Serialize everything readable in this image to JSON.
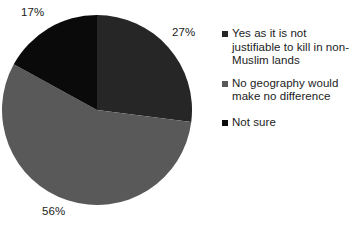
{
  "title": "",
  "chart_data": {
    "type": "pie",
    "title": "",
    "xlabel": "",
    "ylabel": "",
    "legend_position": "right",
    "grid": false,
    "start_angle_deg": 0,
    "direction": "clockwise",
    "categories": [
      "Yes as it is not justifiable to kill in non-Muslim lands",
      "No geography would make no difference",
      "Not sure"
    ],
    "values": [
      27,
      56,
      17
    ],
    "value_unit": "%",
    "data_labels": [
      "27%",
      "56%",
      "17%"
    ],
    "colors": [
      "#262626",
      "#595959",
      "#0a0a0a"
    ],
    "slices": [
      {
        "label": "Yes as it is not justifiable to kill in non-Muslim lands",
        "value": 27,
        "data_label": "27%",
        "color": "#262626"
      },
      {
        "label": "No geography would make no difference",
        "value": 56,
        "data_label": "56%",
        "color": "#595959"
      },
      {
        "label": "Not sure",
        "value": 17,
        "data_label": "17%",
        "color": "#0a0a0a"
      }
    ]
  },
  "legend": {
    "items": [
      {
        "label": "Yes as it is not justifiable to kill in non-Muslim lands",
        "color": "#262626"
      },
      {
        "label": "No geography would make no difference",
        "color": "#595959"
      },
      {
        "label": "Not sure",
        "color": "#0a0a0a"
      }
    ]
  }
}
